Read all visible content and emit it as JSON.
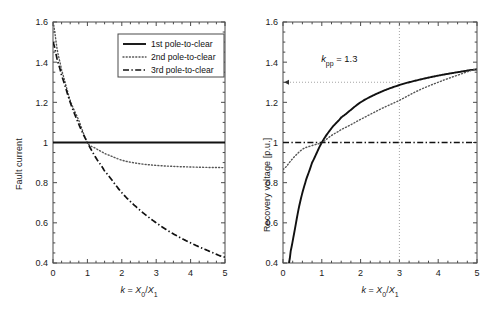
{
  "figure": {
    "background": "#ffffff",
    "axis_color": "#4a4a4a",
    "curve_color": "#111111",
    "dotted_color": "#555555",
    "guide_color": "#9a9a9a"
  },
  "chart_data": [
    {
      "type": "line",
      "panel": "left",
      "title": "",
      "xlabel": "k = X0/X1",
      "xlabel_parts": {
        "sym": "k",
        "eq": " = ",
        "num": "X",
        "numsub": "0",
        "slash": "/",
        "den": "X",
        "densub": "1"
      },
      "ylabel": "Fault current",
      "xlim": [
        0,
        5
      ],
      "ylim": [
        0.4,
        1.6
      ],
      "xticks": [
        0,
        1,
        2,
        3,
        4,
        5
      ],
      "xticklabels": [
        "0",
        "1",
        "2",
        "3",
        "4",
        "5"
      ],
      "yticks": [
        0.4,
        0.6,
        0.8,
        1,
        1.2,
        1.4,
        1.6
      ],
      "yticklabels": [
        "0.4",
        "0.6",
        "0.8",
        "1",
        "1.2",
        "1.4",
        "1.6"
      ],
      "grid": false,
      "legend_position": "upper right",
      "series": [
        {
          "name": "1st pole-to-clear",
          "style": "solid",
          "x": [
            0,
            0.5,
            1,
            1.5,
            2,
            2.5,
            3,
            3.5,
            4,
            4.5,
            5
          ],
          "values": [
            1,
            1,
            1,
            1,
            1,
            1,
            1,
            1,
            1,
            1,
            1
          ]
        },
        {
          "name": "2nd pole-to-clear",
          "style": "dotted",
          "x": [
            0,
            0.125,
            0.25,
            0.5,
            0.75,
            1,
            1.25,
            1.5,
            2,
            2.5,
            3,
            3.5,
            4,
            4.5,
            5
          ],
          "values": [
            1.6,
            1.46,
            1.36,
            1.21,
            1.11,
            1.0,
            0.97,
            0.945,
            0.912,
            0.895,
            0.886,
            0.881,
            0.878,
            0.876,
            0.875
          ]
        },
        {
          "name": "3rd pole-to-clear",
          "style": "dashdot",
          "x": [
            0,
            0.125,
            0.25,
            0.5,
            0.75,
            1,
            1.25,
            1.5,
            2,
            2.5,
            3,
            3.5,
            4,
            4.5,
            5
          ],
          "values": [
            1.5,
            1.412,
            1.333,
            1.2,
            1.091,
            1.0,
            0.923,
            0.857,
            0.75,
            0.667,
            0.6,
            0.545,
            0.5,
            0.462,
            0.429
          ]
        }
      ]
    },
    {
      "type": "line",
      "panel": "right",
      "title": "",
      "xlabel": "k = X0/X1",
      "xlabel_parts": {
        "sym": "k",
        "eq": " = ",
        "num": "X",
        "numsub": "0",
        "slash": "/",
        "den": "X",
        "densub": "1"
      },
      "ylabel": "Recovery voltage [p.u.]",
      "xlim": [
        0,
        5
      ],
      "ylim": [
        0.4,
        1.6
      ],
      "xticks": [
        0,
        1,
        2,
        3,
        4,
        5
      ],
      "xticklabels": [
        "0",
        "1",
        "2",
        "3",
        "4",
        "5"
      ],
      "yticks": [
        0.4,
        0.6,
        0.8,
        1,
        1.2,
        1.4,
        1.6
      ],
      "yticklabels": [
        "0.4",
        "0.6",
        "0.8",
        "1",
        "1.2",
        "1.4",
        "1.6"
      ],
      "grid": false,
      "annotations": [
        {
          "text": "kpp = 1.3",
          "text_parts": {
            "sym": "k",
            "sub": "pp",
            "rest": " = 1.3"
          },
          "x": 1.45,
          "y": 1.4,
          "guide_h_y": 1.3,
          "guide_v_x": 3,
          "arrow": "left"
        }
      ],
      "series": [
        {
          "name": "1st pole-to-clear",
          "style": "solid",
          "x": [
            0.154,
            0.2,
            0.3,
            0.4,
            0.5,
            0.6,
            0.75,
            1,
            1.25,
            1.5,
            2,
            2.5,
            3,
            3.5,
            4,
            4.5,
            5
          ],
          "values": [
            0.4,
            0.462,
            0.562,
            0.667,
            0.75,
            0.818,
            0.9,
            1.0,
            1.071,
            1.125,
            1.2,
            1.25,
            1.286,
            1.312,
            1.333,
            1.35,
            1.364
          ]
        },
        {
          "name": "2nd pole-to-clear",
          "style": "dotted",
          "x": [
            0,
            0.25,
            0.5,
            0.75,
            1,
            1.25,
            1.5,
            2,
            2.5,
            3,
            3.5,
            4,
            4.5,
            5
          ],
          "values": [
            0.866,
            0.92,
            0.966,
            0.985,
            1.0,
            1.035,
            1.065,
            1.115,
            1.165,
            1.21,
            1.26,
            1.3,
            1.335,
            1.365
          ]
        },
        {
          "name": "3rd pole-to-clear",
          "style": "dashdot",
          "x": [
            0,
            0.5,
            1,
            1.5,
            2,
            2.5,
            3,
            3.5,
            4,
            4.5,
            5
          ],
          "values": [
            1,
            1,
            1,
            1,
            1,
            1,
            1,
            1,
            1,
            1,
            1
          ]
        }
      ]
    }
  ],
  "legend": {
    "items": [
      {
        "label": "1st pole-to-clear",
        "style": "solid"
      },
      {
        "label": "2nd pole-to-clear",
        "style": "dotted"
      },
      {
        "label": "3rd pole-to-clear",
        "style": "dashdot"
      }
    ]
  }
}
